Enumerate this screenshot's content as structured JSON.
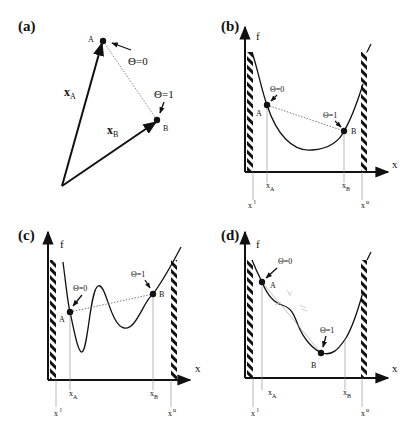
{
  "figure": {
    "panels": [
      {
        "id": "a",
        "label": "(a)",
        "points": {
          "A": "A",
          "B": "B"
        },
        "vectors": {
          "xA": "x",
          "xA_sub": "A",
          "xB": "x",
          "xB_sub": "B"
        },
        "theta0": "Θ=0",
        "theta1": "Θ=1"
      },
      {
        "id": "b",
        "label": "(b)",
        "y_axis": "f",
        "x_axis": "x",
        "points": {
          "A": "A",
          "B": "B"
        },
        "theta0": "Θ=0",
        "theta1": "Θ=1",
        "ticks": {
          "xA": "x",
          "xA_sub": "A",
          "xB": "x",
          "xB_sub": "B",
          "xl": "x",
          "xl_sup": "l",
          "xu": "x",
          "xu_sup": "u"
        }
      },
      {
        "id": "c",
        "label": "(c)",
        "y_axis": "f",
        "x_axis": "x",
        "points": {
          "A": "A",
          "B": "B"
        },
        "theta0": "Θ=0",
        "theta1": "Θ=1",
        "ticks": {
          "xA": "x",
          "xA_sub": "A",
          "xB": "x",
          "xB_sub": "B",
          "xl": "x",
          "xl_sup": "l",
          "xu": "x",
          "xu_sup": "u"
        }
      },
      {
        "id": "d",
        "label": "(d)",
        "y_axis": "f",
        "x_axis": "x",
        "points": {
          "A": "A",
          "B": "B"
        },
        "theta0": "Θ=0",
        "theta1": "Θ=1",
        "ticks": {
          "xA": "x",
          "xA_sub": "A",
          "xB": "x",
          "xB_sub": "B",
          "xl": "x",
          "xl_sup": "l",
          "xu": "x",
          "xu_sup": "u"
        }
      }
    ],
    "colors": {
      "ink": "#111111",
      "guide": "#888888",
      "faint": "#bbbbbb"
    }
  }
}
